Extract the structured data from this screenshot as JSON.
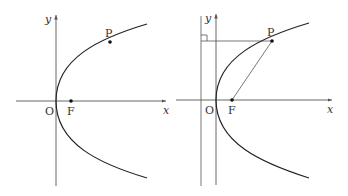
{
  "figures": [
    {
      "id": "left",
      "description": "Parabola y^2 = 4px opening right with focus F and point P on curve",
      "labels": {
        "y_axis": "y",
        "x_axis": "x",
        "origin": "O",
        "focus": "F",
        "point": "P"
      }
    },
    {
      "id": "right",
      "description": "Same parabola with directrix; P connected to F and perpendicular to directrix marked with right-angle symbol",
      "labels": {
        "y_axis": "y",
        "x_axis": "x",
        "origin": "O",
        "focus": "F",
        "point": "P"
      }
    }
  ],
  "colors": {
    "curve": "#222222",
    "axis": "#555555",
    "text": "#333333"
  }
}
